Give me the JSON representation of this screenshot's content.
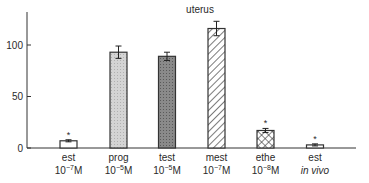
{
  "chart_data": {
    "type": "bar",
    "title": "uterus",
    "xlabel": "",
    "ylabel": "",
    "ylim": [
      0,
      130
    ],
    "yticks": [
      0,
      50,
      100
    ],
    "grid": false,
    "legend": null,
    "categories": [
      {
        "line1": "est",
        "line2": "10",
        "exp": "−7",
        "unit": "M",
        "italic": false
      },
      {
        "line1": "prog",
        "line2": "10",
        "exp": "−5",
        "unit": "M",
        "italic": false
      },
      {
        "line1": "test",
        "line2": "10",
        "exp": "−5",
        "unit": "M",
        "italic": false
      },
      {
        "line1": "mest",
        "line2": "10",
        "exp": "−7",
        "unit": "M",
        "italic": false
      },
      {
        "line1": "ethe",
        "line2": "10",
        "exp": "−8",
        "unit": "M",
        "italic": false
      },
      {
        "line1": "est",
        "line2": "in vivo",
        "exp": "",
        "unit": "",
        "italic": true
      }
    ],
    "category_names": [
      "est 10^-7 M",
      "prog 10^-5 M",
      "test 10^-5 M",
      "mest 10^-7 M",
      "ethe 10^-8 M",
      "est in vivo"
    ],
    "values": [
      7,
      93,
      89,
      116,
      17,
      3
    ],
    "errors": [
      1,
      6,
      4,
      7,
      2,
      1
    ],
    "significance": [
      "*",
      "",
      "",
      "",
      "*",
      "*"
    ],
    "patterns": [
      "white",
      "light-dots",
      "dark-dots",
      "diagonal-hatch",
      "crosshatch",
      "white"
    ]
  }
}
